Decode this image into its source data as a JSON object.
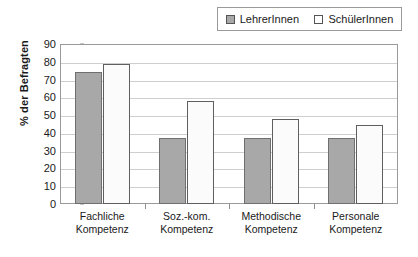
{
  "chart_data": {
    "type": "bar",
    "title": "",
    "xlabel": "",
    "ylabel": "% der Befragten",
    "ylim": [
      0,
      90
    ],
    "ytick_step": 10,
    "yticks": [
      90,
      80,
      70,
      60,
      50,
      40,
      30,
      20,
      10,
      0
    ],
    "grid": true,
    "legend_position": "top-right",
    "categories": [
      "Fachliche Kompetenz",
      "Soz.-kom. Kompetenz",
      "Methodische Kompetenz",
      "Personale Kompetenz"
    ],
    "category_lines": [
      [
        "Fachliche",
        "Kompetenz"
      ],
      [
        "Soz.-kom.",
        "Kompetenz"
      ],
      [
        "Methodische",
        "Kompetenz"
      ],
      [
        "Personale",
        "Kompetenz"
      ]
    ],
    "series": [
      {
        "name": "LehrerInnen",
        "color": "#a8a8a8",
        "values": [
          74,
          37,
          37,
          37
        ]
      },
      {
        "name": "SchülerInnen",
        "color": "#ffffff",
        "values": [
          79,
          58,
          48,
          44.5
        ]
      }
    ]
  },
  "legend": {
    "entries": [
      {
        "label": "LehrerInnen",
        "swatch": "filled-gray-square"
      },
      {
        "label": "SchülerInnen",
        "swatch": "empty-white-square"
      }
    ]
  },
  "colors": {
    "series_teachers": "#a8a8a8",
    "series_students": "#ffffff",
    "gridline": "#cfcfcf",
    "frame": "#9a9a9a",
    "text": "#1a1a1a"
  }
}
